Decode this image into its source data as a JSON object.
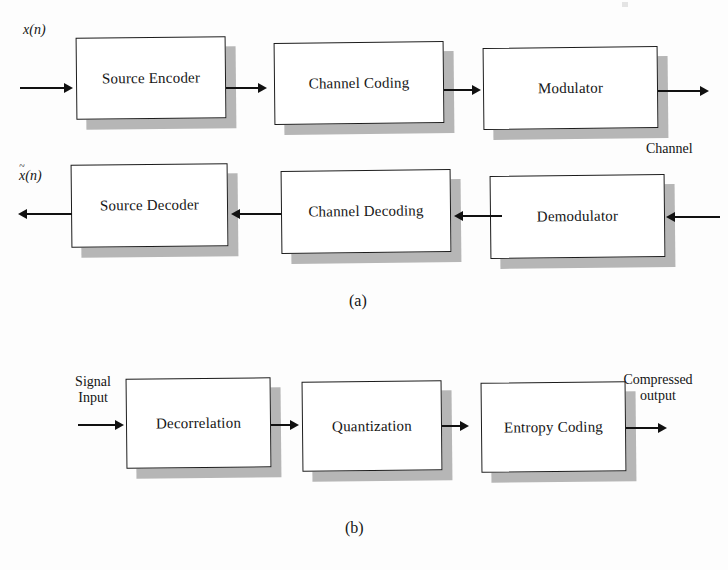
{
  "figure": {
    "kind": "block-diagram",
    "panels": [
      {
        "caption": "(a)",
        "rows": [
          {
            "direction": "left-to-right",
            "input_label": "x(n)",
            "blocks": [
              {
                "label": "Source Encoder"
              },
              {
                "label": "Channel Coding"
              },
              {
                "label": "Modulator"
              }
            ],
            "output_label": ""
          },
          {
            "direction": "right-to-left",
            "input_label": "",
            "blocks": [
              {
                "label": "Source Decoder"
              },
              {
                "label": "Channel Decoding"
              },
              {
                "label": "Demodulator"
              }
            ],
            "output_label": "x~(n)"
          }
        ],
        "annotations": [
          {
            "text": "Channel"
          }
        ]
      },
      {
        "caption": "(b)",
        "rows": [
          {
            "direction": "left-to-right",
            "input_label_line1": "Signal",
            "input_label_line2": "Input",
            "blocks": [
              {
                "label": "Decorrelation"
              },
              {
                "label": "Quantization"
              },
              {
                "label": "Entropy Coding"
              }
            ],
            "output_label_line1": "Compressed",
            "output_label_line2": "output"
          }
        ]
      }
    ]
  },
  "labels": {
    "x_of_n_base": "x",
    "x_of_n_arg": "(n)",
    "x_tilde_base": "x",
    "x_tilde_arg": "(n)",
    "channel": "Channel",
    "signal": "Signal",
    "input": "Input",
    "compressed": "Compressed",
    "output": "output",
    "caption_a": "(a)",
    "caption_b": "(b)"
  },
  "blocks_a_top": [
    {
      "label": "Source Encoder"
    },
    {
      "label": "Channel Coding"
    },
    {
      "label": "Modulator"
    }
  ],
  "blocks_a_bottom": [
    {
      "label": "Source Decoder"
    },
    {
      "label": "Channel Decoding"
    },
    {
      "label": "Demodulator"
    }
  ],
  "blocks_b": [
    {
      "label": "Decorrelation"
    },
    {
      "label": "Quantization"
    },
    {
      "label": "Entropy Coding"
    }
  ],
  "colors": {
    "ink": "#141414",
    "shadow": "#b6b6b6",
    "box_fill": "#ffffff",
    "page": "#fdfdfd"
  }
}
